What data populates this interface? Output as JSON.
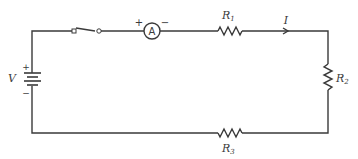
{
  "diagram": {
    "type": "electric circuit (series)",
    "colors": {
      "line": "#3a3a3a",
      "background": "#ffffff"
    },
    "battery": {
      "label": "V",
      "plus": "+",
      "minus": "−"
    },
    "switch": {
      "state": "open"
    },
    "ammeter": {
      "symbol": "A",
      "plus": "+",
      "minus": "−"
    },
    "resistors": [
      {
        "label": "R",
        "sub": "1"
      },
      {
        "label": "R",
        "sub": "2"
      },
      {
        "label": "R",
        "sub": "3"
      }
    ],
    "current": {
      "label": "I",
      "direction": "right"
    }
  }
}
